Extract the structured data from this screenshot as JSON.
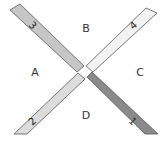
{
  "diagram": {
    "regions": {
      "A": "A",
      "B": "B",
      "C": "C",
      "D": "D"
    },
    "bands": [
      {
        "id": "1",
        "label": "1",
        "color": "#8a8a8a"
      },
      {
        "id": "2",
        "label": "2",
        "color": "#dcdcdc"
      },
      {
        "id": "3",
        "label": "3",
        "color": "#c6c6c6"
      },
      {
        "id": "4",
        "label": "4",
        "color": "#f2f2f2"
      }
    ],
    "outline_color": "#555555"
  }
}
